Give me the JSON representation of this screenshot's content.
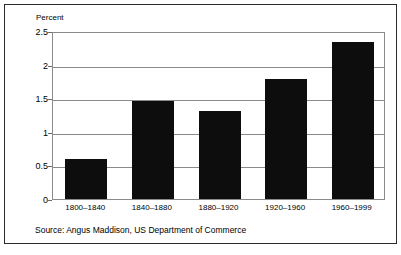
{
  "chart_data": {
    "type": "bar",
    "title": "",
    "subtitle": "",
    "ylabel": "Percent",
    "xlabel": "",
    "categories": [
      "1800–1840",
      "1840–1880",
      "1880–1920",
      "1920–1960",
      "1960–1999"
    ],
    "values": [
      0.6,
      1.46,
      1.31,
      1.78,
      2.34
    ],
    "ylim": [
      0,
      2.5
    ],
    "ytick_labels": [
      "2.5",
      "2",
      "1.5",
      "1",
      "0.5",
      "0"
    ],
    "ytick_values": [
      2.5,
      2,
      1.5,
      1,
      0.5,
      0
    ],
    "grid": true,
    "legend": "none",
    "series": [
      {
        "name": "Average annual growth",
        "values": [
          0.6,
          1.46,
          1.31,
          1.78,
          2.34
        ]
      }
    ],
    "annotation": "Source: Angus Maddison, US Department of Commerce",
    "bar_color": "#0d0d0d",
    "grid_color": "#8a8a8a",
    "background_color": "#ffffff"
  },
  "figure": {
    "axis_title": "Percent",
    "source_note": "Source: Angus Maddison, US Department of Commerce"
  }
}
